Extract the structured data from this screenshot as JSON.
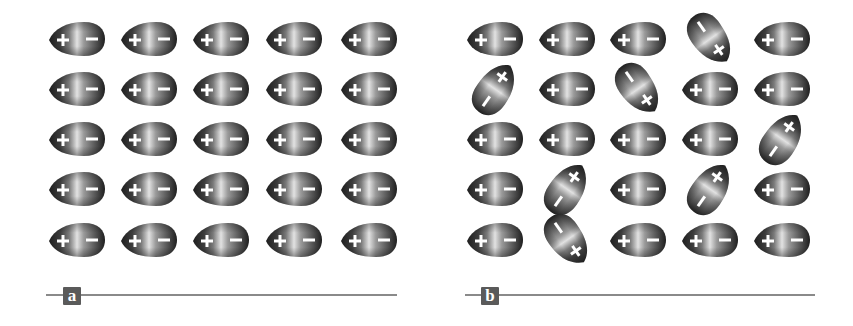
{
  "figure": {
    "colors": {
      "background": "#ffffff",
      "drop_dark": "#1e1e1e",
      "drop_mid": "#7a7a7a",
      "drop_light": "#e2e2e2",
      "sign_color": "#ffffff",
      "baseline": "#8a8a8a",
      "label_box": "#5a5a5a",
      "label_text": "#ffffff"
    },
    "drop_glyphs": {
      "tip_sign": "+",
      "round_sign": "−"
    },
    "panels": [
      {
        "label": "a",
        "description": "Aligned dipoles: 5×5 grid, all oriented + (left) / − (right)",
        "columns_x": [
          77,
          149,
          221,
          294,
          369
        ],
        "rows_y": [
          39,
          89,
          139,
          189,
          240
        ],
        "rotations_deg": [
          [
            0,
            0,
            0,
            0,
            0
          ],
          [
            0,
            0,
            0,
            0,
            0
          ],
          [
            0,
            0,
            0,
            0,
            0
          ],
          [
            0,
            0,
            0,
            0,
            0
          ],
          [
            0,
            0,
            0,
            0,
            0
          ]
        ],
        "baseline": {
          "x1": 46,
          "x2": 397,
          "y": 295
        },
        "label_box": {
          "x": 63,
          "y": 287
        }
      },
      {
        "label": "b",
        "description": "Partially disordered dipoles: 5×5 grid, some rotated",
        "columns_x": [
          495,
          567,
          638,
          710,
          782
        ],
        "rows_y": [
          39,
          89,
          139,
          189,
          240
        ],
        "rotations_deg": [
          [
            0,
            0,
            0,
            -125,
            0
          ],
          [
            125,
            0,
            -125,
            0,
            0
          ],
          [
            0,
            0,
            0,
            0,
            125
          ],
          [
            0,
            125,
            0,
            125,
            0
          ],
          [
            0,
            -125,
            0,
            0,
            0
          ]
        ],
        "baseline": {
          "x1": 465,
          "x2": 815,
          "y": 295
        },
        "label_box": {
          "x": 481,
          "y": 287
        }
      }
    ]
  }
}
